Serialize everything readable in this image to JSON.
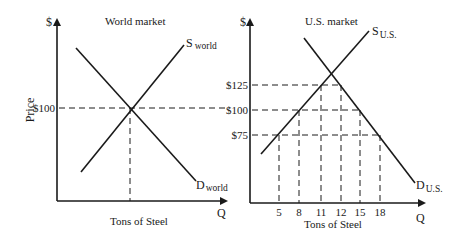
{
  "world_market": {
    "title": "World market",
    "y_axis_symbol": "$",
    "y_axis_label": "Price",
    "x_axis_symbol": "Q",
    "x_axis_label": "Tons of Steel",
    "price_labels": [
      "$100"
    ],
    "supply_label": {
      "main": "S",
      "sub": "world"
    },
    "demand_label": {
      "main": "D",
      "sub": "world"
    }
  },
  "us_market": {
    "title": "U.S. market",
    "y_axis_symbol": "$",
    "x_axis_symbol": "Q",
    "x_axis_label": "Tons of Steel",
    "price_labels": [
      "$125",
      "$100",
      "$75"
    ],
    "quantity_ticks": [
      "5",
      "8",
      "11",
      "12",
      "15",
      "18"
    ],
    "supply_label": {
      "main": "S",
      "sub": "U.S."
    },
    "demand_label": {
      "main": "D",
      "sub": "U.S."
    }
  },
  "chart_data": [
    {
      "type": "line",
      "title": "World market",
      "xlabel": "Tons of Steel",
      "ylabel": "Price",
      "series": [
        {
          "name": "S world",
          "kind": "supply"
        },
        {
          "name": "D world",
          "kind": "demand"
        }
      ],
      "equilibrium_price": 100,
      "reference_prices": [
        100
      ]
    },
    {
      "type": "line",
      "title": "U.S. market",
      "xlabel": "Tons of Steel",
      "ylabel": "$",
      "series": [
        {
          "name": "S U.S.",
          "kind": "supply",
          "points": [
            [
              5,
              75
            ],
            [
              8,
              100
            ],
            [
              11,
              125
            ]
          ]
        },
        {
          "name": "D U.S.",
          "kind": "demand",
          "points": [
            [
              12,
              125
            ],
            [
              15,
              100
            ],
            [
              18,
              75
            ]
          ]
        }
      ],
      "reference_prices": [
        125,
        100,
        75
      ],
      "x_ticks": [
        5,
        8,
        11,
        12,
        15,
        18
      ]
    }
  ]
}
